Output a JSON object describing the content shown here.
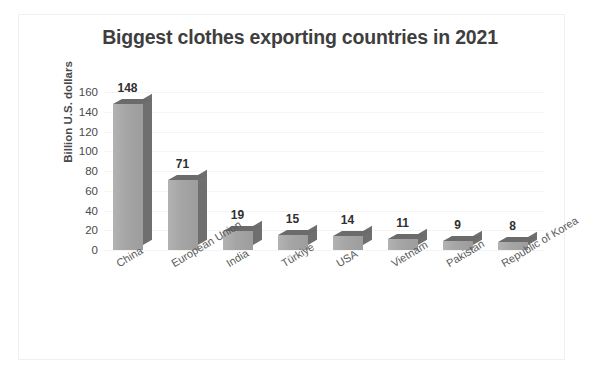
{
  "chart_data": {
    "type": "bar",
    "title": "Biggest clothes exporting countries in 2021",
    "xlabel": "",
    "ylabel": "Billion U.S. dollars",
    "categories": [
      "China",
      "European Union",
      "India",
      "Türkiye",
      "USA",
      "Vietnam",
      "Pakistan",
      "Republic of Korea"
    ],
    "values": [
      148,
      71,
      19,
      15,
      14,
      11,
      9,
      8
    ],
    "value_labels": [
      "148",
      "71",
      "19",
      "15",
      "14",
      "11",
      "9",
      "8"
    ],
    "ylim": [
      0,
      160
    ],
    "ytick_labels": [
      "160",
      "140",
      "120",
      "100",
      "80",
      "60",
      "40",
      "20",
      "0"
    ],
    "ytick_values": [
      160,
      140,
      120,
      100,
      80,
      60,
      40,
      20,
      0
    ],
    "grid": true,
    "legend": "none",
    "style": "3d-column",
    "colors": {
      "bar_front": "#a5a5a5",
      "bar_side": "#6f6f6f",
      "bar_top": "#6b6b6b",
      "gridline": "#f4f4f4",
      "title_text": "#3e3e3e",
      "axis_text": "#4b4b4b",
      "category_text": "#5a5a5a",
      "background": "#ffffff",
      "frame_border": "#f0f0f1"
    }
  }
}
